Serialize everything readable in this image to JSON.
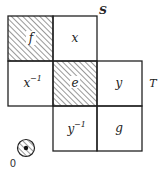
{
  "diagram": {
    "cells": [
      {
        "id": "f",
        "label": "f",
        "col": 0,
        "row": 0,
        "hatched": true
      },
      {
        "id": "x",
        "label": "x",
        "col": 1,
        "row": 0,
        "hatched": false
      },
      {
        "id": "x-inv",
        "label": "x",
        "sup": "−1",
        "col": 0,
        "row": 1,
        "hatched": false
      },
      {
        "id": "e",
        "label": "e",
        "col": 1,
        "row": 1,
        "hatched": true
      },
      {
        "id": "y",
        "label": "y",
        "col": 2,
        "row": 1,
        "hatched": false
      },
      {
        "id": "y-inv",
        "label": "y",
        "sup": "−1",
        "col": 1,
        "row": 2,
        "hatched": false
      },
      {
        "id": "g",
        "label": "g",
        "col": 2,
        "row": 2,
        "hatched": false
      }
    ],
    "labels": {
      "S": "S",
      "T": "T",
      "origin": "0"
    },
    "colors": {
      "line": "#222222",
      "hatch": "#333333",
      "background": "#ffffff"
    }
  }
}
